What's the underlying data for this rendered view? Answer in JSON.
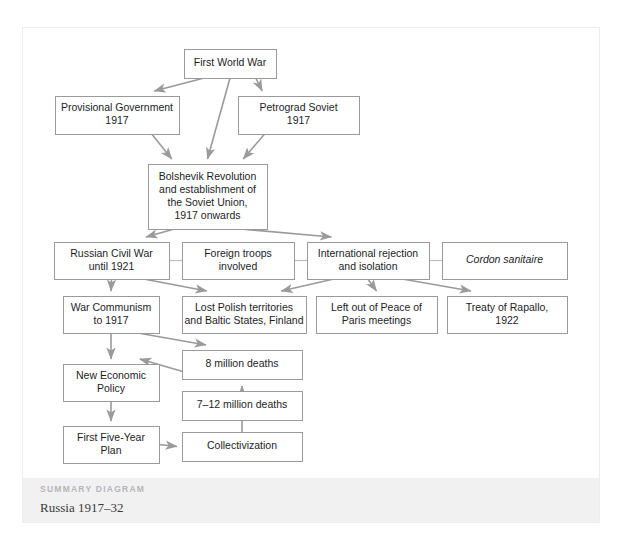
{
  "panel": {
    "footer": {
      "kicker": "SUMMARY DIAGRAM",
      "title": "Russia 1917–32"
    }
  },
  "diagram": {
    "type": "flowchart",
    "title": "Russia 1917–32",
    "nodes": [
      {
        "id": "wwi",
        "label": "First World War",
        "lines": [
          "First World War"
        ],
        "x": 161,
        "y": 21,
        "w": 92,
        "h": 29,
        "italic": false
      },
      {
        "id": "provgov",
        "label": "Provisional Government 1917",
        "lines": [
          "Provisional Government",
          "1917"
        ],
        "x": 32,
        "y": 68,
        "w": 124,
        "h": 38,
        "italic": false
      },
      {
        "id": "petsov",
        "label": "Petrograd Soviet 1917",
        "lines": [
          "Petrograd Soviet",
          "1917"
        ],
        "x": 215,
        "y": 68,
        "w": 121,
        "h": 38,
        "italic": false
      },
      {
        "id": "bolshevik",
        "label": "Bolshevik Revolution and establishment of the Soviet Union, 1917 onwards",
        "lines": [
          "Bolshevik Revolution",
          "and establishment of",
          "the Soviet Union,",
          "1917 onwards"
        ],
        "x": 125,
        "y": 136,
        "w": 119,
        "h": 65,
        "italic": false
      },
      {
        "id": "civilwar",
        "label": "Russian Civil War until 1921",
        "lines": [
          "Russian Civil War",
          "until 1921"
        ],
        "x": 31,
        "y": 214,
        "w": 115,
        "h": 37,
        "italic": false
      },
      {
        "id": "foreign",
        "label": "Foreign troops involved",
        "lines": [
          "Foreign troops",
          "involved"
        ],
        "x": 159,
        "y": 214,
        "w": 112,
        "h": 37,
        "italic": false
      },
      {
        "id": "intreject",
        "label": "International rejection and isolation",
        "lines": [
          "International rejection",
          "and isolation"
        ],
        "x": 284,
        "y": 214,
        "w": 122,
        "h": 37,
        "italic": false
      },
      {
        "id": "cordon",
        "label": "Cordon sanitaire",
        "lines": [
          "Cordon sanitaire"
        ],
        "x": 419,
        "y": 214,
        "w": 125,
        "h": 37,
        "italic": true
      },
      {
        "id": "warcomm",
        "label": "War Communism to 1917",
        "lines": [
          "War Communism",
          "to 1917"
        ],
        "x": 40,
        "y": 268,
        "w": 96,
        "h": 37,
        "italic": false
      },
      {
        "id": "lostpolish",
        "label": "Lost Polish territories and Baltic States, Finland",
        "lines": [
          "Lost Polish territories",
          "and Baltic States, Finland"
        ],
        "x": 159,
        "y": 268,
        "w": 124,
        "h": 37,
        "italic": false
      },
      {
        "id": "leftout",
        "label": "Left out of Peace of Paris meetings",
        "lines": [
          "Left out of Peace of",
          "Paris meetings"
        ],
        "x": 293,
        "y": 268,
        "w": 121,
        "h": 37,
        "italic": false
      },
      {
        "id": "rapallo",
        "label": "Treaty of Rapallo, 1922",
        "lines": [
          "Treaty of Rapallo,",
          "1922"
        ],
        "x": 424,
        "y": 268,
        "w": 120,
        "h": 37,
        "italic": false
      },
      {
        "id": "deaths8",
        "label": "8 million deaths",
        "lines": [
          "8 million deaths"
        ],
        "x": 159,
        "y": 322,
        "w": 120,
        "h": 29,
        "italic": false
      },
      {
        "id": "nep",
        "label": "New Economic Policy",
        "lines": [
          "New Economic",
          "Policy"
        ],
        "x": 40,
        "y": 336,
        "w": 96,
        "h": 37,
        "italic": false
      },
      {
        "id": "deaths712",
        "label": "7–12 million deaths",
        "lines": [
          "7–12 million deaths"
        ],
        "x": 159,
        "y": 363,
        "w": 120,
        "h": 29,
        "italic": false
      },
      {
        "id": "fiveyear",
        "label": "First Five-Year Plan",
        "lines": [
          "First Five-Year",
          "Plan"
        ],
        "x": 40,
        "y": 398,
        "w": 96,
        "h": 37,
        "italic": false
      },
      {
        "id": "collect",
        "label": "Collectivization",
        "lines": [
          "Collectivization"
        ],
        "x": 159,
        "y": 404,
        "w": 120,
        "h": 29,
        "italic": false
      }
    ],
    "edges": [
      {
        "from": "wwi",
        "to": "provgov",
        "arrow": true,
        "kind": "diagonal"
      },
      {
        "from": "wwi",
        "to": "petsov",
        "arrow": true,
        "kind": "diagonal"
      },
      {
        "from": "wwi",
        "to": "bolshevik",
        "arrow": true,
        "kind": "vertical"
      },
      {
        "from": "provgov",
        "to": "bolshevik",
        "arrow": true,
        "kind": "diagonal"
      },
      {
        "from": "petsov",
        "to": "bolshevik",
        "arrow": true,
        "kind": "diagonal"
      },
      {
        "from": "bolshevik",
        "to": "civilwar",
        "arrow": true,
        "kind": "diagonal"
      },
      {
        "from": "bolshevik",
        "to": "intreject",
        "arrow": true,
        "kind": "diagonal"
      },
      {
        "from": "civilwar",
        "to": "foreign",
        "arrow": false,
        "kind": "link"
      },
      {
        "from": "foreign",
        "to": "intreject",
        "arrow": false,
        "kind": "link"
      },
      {
        "from": "intreject",
        "to": "cordon",
        "arrow": false,
        "kind": "link"
      },
      {
        "from": "civilwar",
        "to": "warcomm",
        "arrow": true,
        "kind": "vertical"
      },
      {
        "from": "civilwar",
        "to": "lostpolish",
        "arrow": true,
        "kind": "diagonal"
      },
      {
        "from": "intreject",
        "to": "lostpolish",
        "arrow": true,
        "kind": "diagonal"
      },
      {
        "from": "intreject",
        "to": "leftout",
        "arrow": true,
        "kind": "vertical"
      },
      {
        "from": "intreject",
        "to": "rapallo",
        "arrow": true,
        "kind": "diagonal"
      },
      {
        "from": "warcomm",
        "to": "deaths8",
        "arrow": true,
        "kind": "diagonal"
      },
      {
        "from": "warcomm",
        "to": "nep",
        "arrow": true,
        "kind": "vertical"
      },
      {
        "from": "deaths8",
        "to": "nep",
        "arrow": true,
        "kind": "diagonal"
      },
      {
        "from": "nep",
        "to": "fiveyear",
        "arrow": true,
        "kind": "vertical"
      },
      {
        "from": "fiveyear",
        "to": "collect",
        "arrow": true,
        "kind": "horizontal"
      },
      {
        "from": "collect",
        "to": "deaths712",
        "arrow": true,
        "kind": "vertical"
      }
    ]
  }
}
